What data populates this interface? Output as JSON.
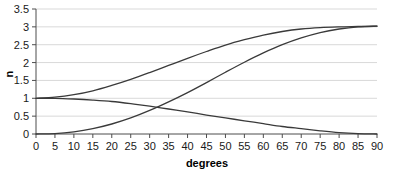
{
  "chart_data": {
    "type": "line",
    "title": "",
    "xlabel": "degrees",
    "ylabel": "n",
    "xlim": [
      0,
      90
    ],
    "ylim": [
      0,
      3.5
    ],
    "grid": true,
    "grid_axis": "y",
    "legend": false,
    "x_ticks": [
      0,
      5,
      10,
      15,
      20,
      25,
      30,
      35,
      40,
      45,
      50,
      55,
      60,
      65,
      70,
      75,
      80,
      85,
      90
    ],
    "x_tick_labels": [
      "0",
      "5",
      "10",
      "15",
      "20",
      "25",
      "30",
      "35",
      "40",
      "45",
      "50",
      "55",
      "60",
      "65",
      "70",
      "75",
      "80",
      "85",
      "90"
    ],
    "y_ticks": [
      0,
      0.5,
      1,
      1.5,
      2,
      2.5,
      3,
      3.5
    ],
    "y_tick_labels": [
      "0",
      "0.5",
      "1",
      "1.5",
      "2",
      "2.5",
      "3",
      "3.5"
    ],
    "line_color": "#3a3a3a",
    "grid_color": "#d9d9d9",
    "axis_color": "#4d4d4d",
    "x": [
      0,
      5,
      10,
      15,
      20,
      25,
      30,
      35,
      40,
      45,
      50,
      55,
      60,
      65,
      70,
      75,
      80,
      85,
      90
    ],
    "series": [
      {
        "name": "curve-upper",
        "description": "rises from 1 at 0 degrees to 3 at 90 degrees",
        "values": [
          1.0,
          1.03,
          1.1,
          1.21,
          1.36,
          1.53,
          1.72,
          1.92,
          2.12,
          2.31,
          2.49,
          2.64,
          2.77,
          2.87,
          2.94,
          2.98,
          3.0,
          3.01,
          3.02
        ]
      },
      {
        "name": "curve-sigmoid",
        "description": "rises from 0 at 0 degrees to 3 at 90 degrees, steepest near 55 degrees",
        "values": [
          0.0,
          0.01,
          0.06,
          0.15,
          0.28,
          0.45,
          0.66,
          0.9,
          1.16,
          1.44,
          1.73,
          2.01,
          2.27,
          2.5,
          2.69,
          2.84,
          2.94,
          3.0,
          3.02
        ]
      },
      {
        "name": "curve-decreasing",
        "description": "falls from 1 at 0 degrees to 0 at 90 degrees",
        "values": [
          1.0,
          1.0,
          0.98,
          0.95,
          0.91,
          0.85,
          0.78,
          0.7,
          0.62,
          0.53,
          0.45,
          0.37,
          0.29,
          0.21,
          0.15,
          0.09,
          0.04,
          0.01,
          0.0
        ]
      }
    ]
  }
}
